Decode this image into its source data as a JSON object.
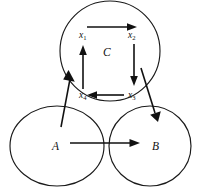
{
  "figure": {
    "type": "node-link-diagram",
    "background_color": "#ffffff",
    "stroke_color": "#111111",
    "sets": [
      {
        "id": "C",
        "label": "C",
        "shape": "circle",
        "cx": 110,
        "cy": 51,
        "rx": 50,
        "ry": 50,
        "label_x": 103,
        "label_y": 56
      },
      {
        "id": "A",
        "label": "A",
        "shape": "ellipse",
        "cx": 57,
        "cy": 146,
        "rx": 47,
        "ry": 40,
        "label_x": 52,
        "label_y": 150
      },
      {
        "id": "B",
        "label": "B",
        "shape": "ellipse",
        "cx": 150,
        "cy": 146,
        "rx": 41,
        "ry": 40,
        "label_x": 152,
        "label_y": 150
      }
    ],
    "nodes": [
      {
        "id": "x1",
        "base": "x",
        "sub": "1",
        "x": 79,
        "y": 38
      },
      {
        "id": "x2",
        "base": "x",
        "sub": "2",
        "x": 128,
        "y": 38
      },
      {
        "id": "x3",
        "base": "x",
        "sub": "3",
        "x": 128,
        "y": 98
      },
      {
        "id": "x4",
        "base": "x",
        "sub": "4",
        "x": 79,
        "y": 98
      }
    ],
    "edges": [
      {
        "id": "x1-to-x2",
        "from": "x1",
        "to": "x2",
        "direction": "right",
        "style": "straight"
      },
      {
        "id": "x2-to-x3",
        "from": "x2",
        "to": "x3",
        "direction": "down",
        "style": "straight"
      },
      {
        "id": "x3-to-x4",
        "from": "x3",
        "to": "x4",
        "direction": "left",
        "style": "straight"
      },
      {
        "id": "x4-to-x1",
        "from": "x4",
        "to": "x1",
        "direction": "up",
        "style": "straight"
      },
      {
        "id": "A-to-C",
        "from": "A",
        "to": "C",
        "direction": "up-left-diagonal",
        "style": "straight"
      },
      {
        "id": "C-to-B",
        "from": "C",
        "to": "B",
        "direction": "down-right-diagonal",
        "style": "straight"
      },
      {
        "id": "A-to-B",
        "from": "A",
        "to": "B",
        "direction": "right",
        "style": "straight"
      }
    ]
  }
}
